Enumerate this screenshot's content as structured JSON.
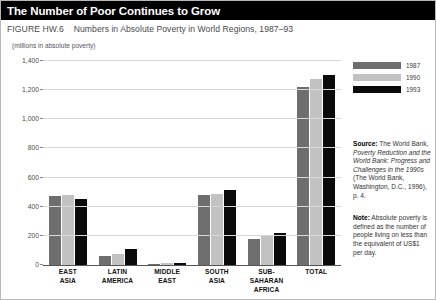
{
  "header": {
    "title": "The Number of Poor Continues to Grow"
  },
  "caption": {
    "figure_number": "FIGURE HW.6",
    "figure_title": "Numbers  in Absolute Poverty in World Regions, 1987–93",
    "units": "(millions in absolute poverty)"
  },
  "legend": {
    "items": [
      {
        "label": "1987",
        "color": "#6e6e6e"
      },
      {
        "label": "1990",
        "color": "#c2c2c2"
      },
      {
        "label": "1993",
        "color": "#0a0a0a"
      }
    ]
  },
  "notes": {
    "source": {
      "lead": "Source:",
      "text_before_italic": " The World Bank, ",
      "italic": "Poverty Reduction and the World Bank: Progress and Challenges in the 1990s",
      "text_after_italic": " (The World Bank, Washington, D.C., 1996), p. 4."
    },
    "note": {
      "lead": "Note:",
      "text": " Absolute poverty is defined as the number of people living on less than the equivalent of US$1 per day."
    }
  },
  "chart_data": {
    "type": "bar",
    "title": "Numbers in Absolute Poverty in World Regions, 1987–93",
    "subtitle": "(millions in absolute poverty)",
    "xlabel": "",
    "ylabel": "(millions in absolute poverty)",
    "ylim": [
      0,
      1400
    ],
    "yticks": [
      0,
      200,
      400,
      600,
      800,
      1000,
      1200,
      1400
    ],
    "ytick_labels": [
      "0",
      "200",
      "400",
      "600",
      "800",
      "1,000",
      "1,200",
      "1,400"
    ],
    "grid": true,
    "legend_position": "top-right",
    "categories": [
      "EAST ASIA",
      "LATIN AMERICA",
      "MIDDLE EAST",
      "SOUTH ASIA",
      "SUB-SAHARAN AFRICA",
      "TOTAL"
    ],
    "category_lines": [
      [
        "EAST",
        "ASIA"
      ],
      [
        "LATIN",
        "AMERICA"
      ],
      [
        "MIDDLE",
        "EAST"
      ],
      [
        "SOUTH",
        "ASIA"
      ],
      [
        "SUB-SAHARAN",
        "AFRICA"
      ],
      [
        "TOTAL"
      ]
    ],
    "series": [
      {
        "name": "1987",
        "color": "#6e6e6e",
        "values": [
          475,
          65,
          10,
          480,
          180,
          1225
        ]
      },
      {
        "name": "1990",
        "color": "#c2c2c2",
        "values": [
          480,
          75,
          12,
          490,
          200,
          1275
        ]
      },
      {
        "name": "1993",
        "color": "#0a0a0a",
        "values": [
          455,
          110,
          15,
          515,
          220,
          1305
        ]
      }
    ]
  }
}
